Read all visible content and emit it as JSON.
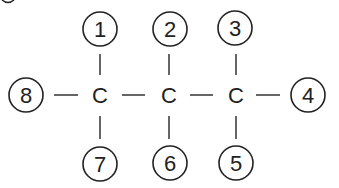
{
  "diagram": {
    "type": "structural-formula",
    "colors": {
      "ink": "#222222",
      "background": "#ffffff"
    },
    "carbons": [
      {
        "id": "c1",
        "label": "C",
        "x": 100,
        "y": 95
      },
      {
        "id": "c2",
        "label": "C",
        "x": 169,
        "y": 95
      },
      {
        "id": "c3",
        "label": "C",
        "x": 236,
        "y": 95
      }
    ],
    "positions": [
      {
        "id": "p1",
        "label": "1",
        "x": 100,
        "y": 29,
        "attached_to": "c1"
      },
      {
        "id": "p2",
        "label": "2",
        "x": 170,
        "y": 29,
        "attached_to": "c2"
      },
      {
        "id": "p3",
        "label": "3",
        "x": 235,
        "y": 28,
        "attached_to": "c3"
      },
      {
        "id": "p4",
        "label": "4",
        "x": 308,
        "y": 95,
        "attached_to": "c3"
      },
      {
        "id": "p5",
        "label": "5",
        "x": 236,
        "y": 163,
        "attached_to": "c3"
      },
      {
        "id": "p6",
        "label": "6",
        "x": 170,
        "y": 163,
        "attached_to": "c2"
      },
      {
        "id": "p7",
        "label": "7",
        "x": 100,
        "y": 164,
        "attached_to": "c1"
      },
      {
        "id": "p8",
        "label": "8",
        "x": 26,
        "y": 95,
        "attached_to": "c1"
      }
    ]
  }
}
